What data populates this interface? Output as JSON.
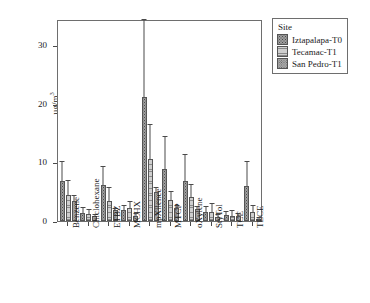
{
  "chart_data": {
    "type": "bar",
    "title": "",
    "xlabel": "",
    "ylabel": "µg/m",
    "ylabel_sup": "3",
    "ylim": [
      0,
      34.5
    ],
    "yticks": [
      0,
      10,
      20,
      30
    ],
    "ytick_labels": [
      "0",
      "10",
      "20",
      "30"
    ],
    "grid": false,
    "legend_position": "right-top",
    "legend_title": "Site",
    "categories": [
      "Benzene",
      "Chiclohexane",
      "ETBZ",
      "MCHX",
      "mpXilence",
      "MTCP",
      "oXylene",
      "StyTol",
      "TCE",
      "TECE"
    ],
    "series": [
      {
        "name": "Iztapalapa-T0",
        "values": [
          6.8,
          1.4,
          6.2,
          1.8,
          21.1,
          8.9,
          6.8,
          1.6,
          1.0,
          5.9
        ],
        "err_upper": [
          10.0,
          2.2,
          9.3,
          2.5,
          34.3,
          14.4,
          11.2,
          2.4,
          1.5,
          10.1
        ]
      },
      {
        "name": "Tecamac-T1",
        "values": [
          4.5,
          1.2,
          3.4,
          2.3,
          10.6,
          3.6,
          4.1,
          1.6,
          0.9,
          1.5
        ],
        "err_upper": [
          6.8,
          1.8,
          5.6,
          3.2,
          16.4,
          5.0,
          6.1,
          2.9,
          1.7,
          2.6
        ]
      },
      {
        "name": "San Pedro-T1",
        "values": [
          3.5,
          0.8,
          1.8,
          0.9,
          5.0,
          2.2,
          2.0,
          0.7,
          0.9,
          0.4
        ],
        "err_upper": [
          4.2,
          1.1,
          2.1,
          1.2,
          5.6,
          2.6,
          2.4,
          1.0,
          1.2,
          0.6
        ]
      }
    ],
    "colors": {
      "series_0": "#9e9e9e",
      "series_1": "#cfcfcf",
      "series_2": "#a8a8a8",
      "axis": "#4a4a4a",
      "frame": "#6e6e6e",
      "background": "#ffffff"
    }
  }
}
